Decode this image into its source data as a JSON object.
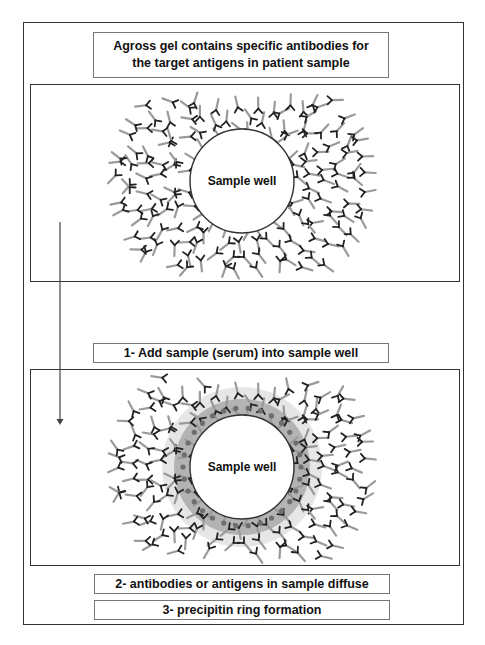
{
  "title": {
    "line1": "Agross gel contains specific antibodies for",
    "line2": "the target antigens in patient sample"
  },
  "panels": [
    {
      "id": "before",
      "well_label": "Sample well",
      "show_precipitin_ring": false
    },
    {
      "id": "after",
      "well_label": "Sample well",
      "show_precipitin_ring": true
    }
  ],
  "steps": [
    {
      "label": "1- Add sample (serum) into sample well"
    },
    {
      "label": "2- antibodies or antigens in sample diffuse"
    },
    {
      "label": "3- precipitin ring formation"
    }
  ],
  "colors": {
    "border": "#333333",
    "antibody_stem": "#9a9a9a",
    "antibody_arm": "#222222",
    "precipitin_ring": "#b3b3b3",
    "antigen_dot": "#6e6e6e",
    "label_box_border": "#777777"
  },
  "icons": {
    "arrow": "down-arrow",
    "antibody": "y-shaped-antibody"
  }
}
